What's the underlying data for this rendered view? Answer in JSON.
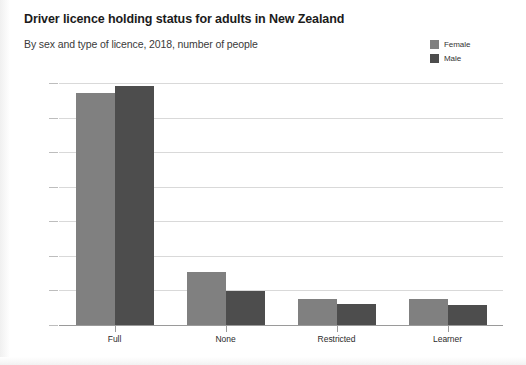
{
  "header": {
    "title": "Driver licence holding status for adults in New Zealand",
    "subtitle": "By sex and type of licence, 2018, number of people"
  },
  "legend": {
    "position": "top-right",
    "items": [
      {
        "label": "Female",
        "color": "#808080"
      },
      {
        "label": "Male",
        "color": "#4d4d4d"
      }
    ]
  },
  "axis": {
    "y_ticks": [
      "1,400,000",
      "1,200,000",
      "1,000,000",
      "800,000",
      "600,000",
      "400,000",
      "200,000",
      "0"
    ],
    "x_labels": [
      "Full",
      "None",
      "Restricted",
      "Learner"
    ]
  },
  "chart_data": {
    "type": "bar",
    "title": "Driver licence holding status for adults in New Zealand",
    "subtitle": "By sex and type of licence, 2018, number of people",
    "xlabel": "",
    "ylabel": "",
    "ylim": [
      0,
      1400000
    ],
    "ytick_step": 200000,
    "yticks": [
      0,
      200000,
      400000,
      600000,
      800000,
      1000000,
      1200000,
      1400000
    ],
    "grid": true,
    "legend_position": "top-right",
    "categories": [
      "Full",
      "None",
      "Restricted",
      "Learner"
    ],
    "series": [
      {
        "name": "Female",
        "color": "#808080",
        "values": [
          1340000,
          305000,
          150000,
          150000
        ]
      },
      {
        "name": "Male",
        "color": "#4d4d4d",
        "values": [
          1385000,
          195000,
          120000,
          115000
        ]
      }
    ]
  }
}
